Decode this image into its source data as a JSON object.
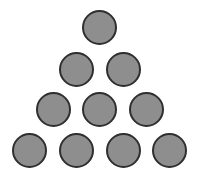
{
  "diagram": {
    "type": "triangular-arrangement",
    "rows": [
      1,
      2,
      3,
      4
    ],
    "total_circles": 10,
    "circle": {
      "diameter": 35,
      "fill": "#8e8e8e",
      "stroke": "#2f2f2f",
      "stroke_width": 2
    },
    "circles": [
      {
        "row": 1,
        "cx": 99.5,
        "cy": 27.5
      },
      {
        "row": 2,
        "cx": 76,
        "cy": 69
      },
      {
        "row": 2,
        "cx": 123,
        "cy": 69
      },
      {
        "row": 3,
        "cx": 53,
        "cy": 109
      },
      {
        "row": 3,
        "cx": 99.5,
        "cy": 109
      },
      {
        "row": 3,
        "cx": 146,
        "cy": 109
      },
      {
        "row": 4,
        "cx": 29,
        "cy": 150
      },
      {
        "row": 4,
        "cx": 76,
        "cy": 150
      },
      {
        "row": 4,
        "cx": 123,
        "cy": 150
      },
      {
        "row": 4,
        "cx": 169,
        "cy": 150
      }
    ],
    "background": "#ffffff"
  }
}
